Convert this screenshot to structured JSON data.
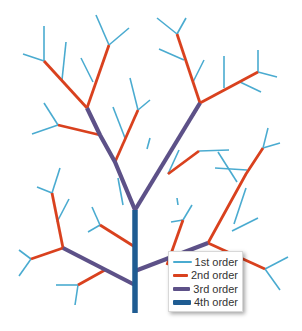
{
  "colors": {
    "order1": "#4aabd0",
    "order2": "#d9411e",
    "order3": "#5d5188",
    "order4": "#1f5c92"
  },
  "widths": {
    "order1": 1.6,
    "order2": 2.8,
    "order3": 4.2,
    "order4": 5.5
  },
  "legend": {
    "items": [
      {
        "label": "1st order",
        "order": "order1"
      },
      {
        "label": "2nd order",
        "order": "order2"
      },
      {
        "label": "3rd order",
        "order": "order3"
      },
      {
        "label": "4th order",
        "order": "order4"
      }
    ]
  },
  "segments": [
    {
      "o": "order4",
      "p": [
        [
          135,
          313
        ],
        [
          135,
          210
        ]
      ]
    },
    {
      "o": "order3",
      "p": [
        [
          135,
          210
        ],
        [
          115,
          162
        ],
        [
          100,
          135
        ],
        [
          87,
          108
        ]
      ]
    },
    {
      "o": "order3",
      "p": [
        [
          135,
          210
        ],
        [
          200,
          103
        ]
      ]
    },
    {
      "o": "order3",
      "p": [
        [
          135,
          285
        ],
        [
          63,
          248
        ]
      ]
    },
    {
      "o": "order3",
      "p": [
        [
          135,
          271
        ],
        [
          208,
          243
        ]
      ]
    },
    {
      "o": "order2",
      "p": [
        [
          87,
          108
        ],
        [
          44,
          61
        ]
      ]
    },
    {
      "o": "order2",
      "p": [
        [
          87,
          108
        ],
        [
          109,
          45
        ]
      ]
    },
    {
      "o": "order2",
      "p": [
        [
          100,
          135
        ],
        [
          58,
          125
        ]
      ]
    },
    {
      "o": "order2",
      "p": [
        [
          115,
          162
        ],
        [
          138,
          110
        ]
      ]
    },
    {
      "o": "order2",
      "p": [
        [
          200,
          103
        ],
        [
          177,
          34
        ]
      ]
    },
    {
      "o": "order2",
      "p": [
        [
          200,
          103
        ],
        [
          258,
          72
        ]
      ]
    },
    {
      "o": "order2",
      "p": [
        [
          193,
          115
        ],
        [
          200,
          103
        ]
      ]
    },
    {
      "o": "order2",
      "p": [
        [
          168,
          174
        ],
        [
          199,
          151
        ]
      ]
    },
    {
      "o": "order2",
      "p": [
        [
          208,
          243
        ],
        [
          246,
          174
        ],
        [
          263,
          148
        ]
      ]
    },
    {
      "o": "order2",
      "p": [
        [
          208,
          243
        ],
        [
          265,
          269
        ]
      ]
    },
    {
      "o": "order2",
      "p": [
        [
          63,
          248
        ],
        [
          52,
          193
        ]
      ]
    },
    {
      "o": "order2",
      "p": [
        [
          63,
          248
        ],
        [
          31,
          259
        ]
      ]
    },
    {
      "o": "order2",
      "p": [
        [
          105,
          270
        ],
        [
          78,
          285
        ]
      ]
    },
    {
      "o": "order2",
      "p": [
        [
          135,
          247
        ],
        [
          100,
          225
        ]
      ]
    },
    {
      "o": "order2",
      "p": [
        [
          167,
          265
        ],
        [
          183,
          220
        ]
      ]
    },
    {
      "o": "order1",
      "p": [
        [
          44,
          61
        ],
        [
          44,
          26
        ]
      ]
    },
    {
      "o": "order1",
      "p": [
        [
          44,
          61
        ],
        [
          23,
          54
        ]
      ]
    },
    {
      "o": "order1",
      "p": [
        [
          62,
          80
        ],
        [
          66,
          42
        ]
      ]
    },
    {
      "o": "order1",
      "p": [
        [
          93,
          82
        ],
        [
          81,
          58
        ]
      ]
    },
    {
      "o": "order1",
      "p": [
        [
          109,
          45
        ],
        [
          96,
          15
        ]
      ]
    },
    {
      "o": "order1",
      "p": [
        [
          109,
          45
        ],
        [
          129,
          28
        ]
      ]
    },
    {
      "o": "order1",
      "p": [
        [
          58,
          125
        ],
        [
          44,
          103
        ]
      ]
    },
    {
      "o": "order1",
      "p": [
        [
          58,
          125
        ],
        [
          32,
          134
        ]
      ]
    },
    {
      "o": "order1",
      "p": [
        [
          125,
          138
        ],
        [
          113,
          107
        ]
      ]
    },
    {
      "o": "order1",
      "p": [
        [
          138,
          110
        ],
        [
          130,
          78
        ]
      ]
    },
    {
      "o": "order1",
      "p": [
        [
          138,
          110
        ],
        [
          150,
          100
        ]
      ]
    },
    {
      "o": "order1",
      "p": [
        [
          177,
          34
        ],
        [
          157,
          18
        ]
      ]
    },
    {
      "o": "order1",
      "p": [
        [
          177,
          34
        ],
        [
          186,
          18
        ]
      ]
    },
    {
      "o": "order1",
      "p": [
        [
          184,
          60
        ],
        [
          159,
          49
        ]
      ]
    },
    {
      "o": "order1",
      "p": [
        [
          193,
          82
        ],
        [
          204,
          60
        ]
      ]
    },
    {
      "o": "order1",
      "p": [
        [
          224,
          88
        ],
        [
          224,
          56
        ]
      ]
    },
    {
      "o": "order1",
      "p": [
        [
          240,
          82
        ],
        [
          261,
          92
        ]
      ]
    },
    {
      "o": "order1",
      "p": [
        [
          258,
          72
        ],
        [
          258,
          50
        ]
      ]
    },
    {
      "o": "order1",
      "p": [
        [
          258,
          72
        ],
        [
          277,
          77
        ]
      ]
    },
    {
      "o": "order1",
      "p": [
        [
          123,
          205
        ],
        [
          118,
          178
        ]
      ]
    },
    {
      "o": "order1",
      "p": [
        [
          168,
          174
        ],
        [
          179,
          150
        ]
      ]
    },
    {
      "o": "order1",
      "p": [
        [
          199,
          151
        ],
        [
          229,
          150
        ]
      ]
    },
    {
      "o": "order1",
      "p": [
        [
          263,
          148
        ],
        [
          268,
          128
        ]
      ]
    },
    {
      "o": "order1",
      "p": [
        [
          263,
          148
        ],
        [
          280,
          143
        ]
      ]
    },
    {
      "o": "order1",
      "p": [
        [
          247,
          170
        ],
        [
          215,
          168
        ]
      ]
    },
    {
      "o": "order1",
      "p": [
        [
          237,
          182
        ],
        [
          218,
          152
        ]
      ]
    },
    {
      "o": "order1",
      "p": [
        [
          232,
          231
        ],
        [
          258,
          218
        ]
      ]
    },
    {
      "o": "order1",
      "p": [
        [
          234,
          224
        ],
        [
          246,
          188
        ]
      ]
    },
    {
      "o": "order1",
      "p": [
        [
          265,
          269
        ],
        [
          288,
          257
        ]
      ]
    },
    {
      "o": "order1",
      "p": [
        [
          265,
          269
        ],
        [
          280,
          290
        ]
      ]
    },
    {
      "o": "order1",
      "p": [
        [
          52,
          193
        ],
        [
          37,
          187
        ]
      ]
    },
    {
      "o": "order1",
      "p": [
        [
          52,
          193
        ],
        [
          60,
          168
        ]
      ]
    },
    {
      "o": "order1",
      "p": [
        [
          57,
          222
        ],
        [
          69,
          199
        ]
      ]
    },
    {
      "o": "order1",
      "p": [
        [
          31,
          259
        ],
        [
          19,
          276
        ]
      ]
    },
    {
      "o": "order1",
      "p": [
        [
          31,
          259
        ],
        [
          19,
          250
        ]
      ]
    },
    {
      "o": "order1",
      "p": [
        [
          78,
          285
        ],
        [
          56,
          285
        ]
      ]
    },
    {
      "o": "order1",
      "p": [
        [
          78,
          285
        ],
        [
          75,
          305
        ]
      ]
    },
    {
      "o": "order1",
      "p": [
        [
          100,
          225
        ],
        [
          92,
          207
        ]
      ]
    },
    {
      "o": "order1",
      "p": [
        [
          100,
          225
        ],
        [
          88,
          232
        ]
      ]
    },
    {
      "o": "order1",
      "p": [
        [
          183,
          220
        ],
        [
          192,
          205
        ]
      ]
    },
    {
      "o": "order1",
      "p": [
        [
          183,
          220
        ],
        [
          171,
          222
        ]
      ]
    },
    {
      "o": "order1",
      "p": [
        [
          178,
          205
        ],
        [
          177,
          198
        ]
      ]
    },
    {
      "o": "order1",
      "p": [
        [
          147,
          149
        ],
        [
          150,
          138
        ]
      ]
    }
  ]
}
